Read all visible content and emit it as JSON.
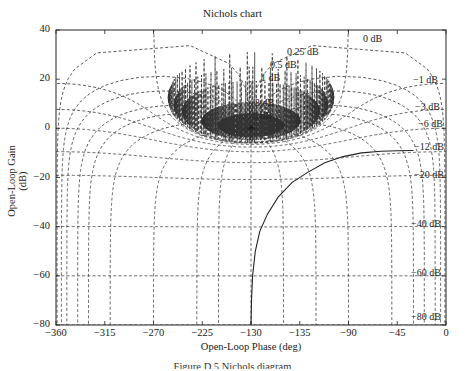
{
  "chart_data": {
    "type": "line",
    "title": "Nichols chart",
    "xlabel": "Open-Loop Phase (deg)",
    "ylabel": "Open-Loop Gain (dB)",
    "xlim": [
      -360,
      0
    ],
    "ylim": [
      -80,
      40
    ],
    "grid": true,
    "x_ticks": [
      -360,
      -315,
      -270,
      -225,
      -180,
      -135,
      -90,
      -45,
      0
    ],
    "x_tick_labels": [
      "-360",
      "-315",
      "-270",
      "-225",
      "-130",
      "-135",
      "-90",
      "-45",
      "0"
    ],
    "y_ticks": [
      40,
      20,
      0,
      -20,
      -40,
      -60,
      -80
    ],
    "y_tick_labels": [
      "40",
      "20",
      "0",
      "-20",
      "-40",
      "-60",
      "-80"
    ],
    "m_contours_db": [
      0,
      0.25,
      0.5,
      1,
      3,
      6,
      -1,
      -3,
      -6,
      -12,
      -20,
      -40,
      -60,
      -80
    ],
    "m_contour_labels": [
      "0 dB",
      "0.25 dB",
      "0.5 dB",
      "1 dB",
      "3 dB",
      "6 dB",
      "-1 dB",
      "-3 dB",
      "-6 dB",
      "-12 dB",
      "-20 dB",
      "-40 dB",
      "-60 dB",
      "-80 dB"
    ],
    "n_contours_deg": [
      -1,
      -5,
      -10,
      -20,
      -30,
      -50,
      -90,
      -120,
      -150,
      -180,
      -210,
      -230,
      -270,
      -310,
      -330,
      -340,
      -350,
      -355,
      -359
    ],
    "critical_point": {
      "phase": -180,
      "gain_db": 0,
      "marker": "+"
    },
    "series": [
      {
        "name": "Open-loop response",
        "style": "solid",
        "points": [
          [
            -180,
            -80
          ],
          [
            -179.5,
            -70
          ],
          [
            -178.5,
            -60
          ],
          [
            -176,
            -50
          ],
          [
            -172,
            -42
          ],
          [
            -165,
            -35
          ],
          [
            -155,
            -28
          ],
          [
            -142,
            -22
          ],
          [
            -128,
            -18
          ],
          [
            -112,
            -14
          ],
          [
            -95,
            -11.5
          ],
          [
            -78,
            -10
          ],
          [
            -60,
            -9.3
          ],
          [
            -45,
            -9.1
          ],
          [
            -30,
            -9.0
          ]
        ]
      }
    ]
  },
  "figure": {
    "caption": "Figure D.5  Nichols diagram"
  }
}
